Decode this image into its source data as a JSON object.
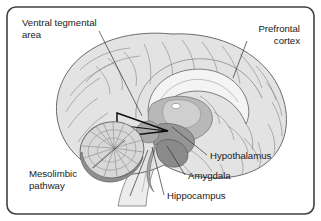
{
  "figure": {
    "type": "anatomical-diagram",
    "background_color": "#ffffff",
    "frame": {
      "shape": "rounded-rectangle",
      "stroke_color": "#404040",
      "corner_radius": 9
    },
    "palette": {
      "cortex_fill": "#e3e3e3",
      "cortex_stroke": "#6b6b6b",
      "gyri_line": "#808080",
      "cerebellum_fill": "#d8d8d8",
      "cerebellum_rim": "#8a8a8a",
      "limbic_mid_gray": "#b4b4b4",
      "limbic_dark_gray": "#8e8e8e",
      "vta_outline": "#101010",
      "white_matter": "#f2f2f2",
      "label_text": "#1a1a1a",
      "leader_line": "#303030"
    }
  },
  "labels": [
    {
      "id": "ventral-tegmental-area",
      "lines": [
        "Ventral tegmental",
        "area"
      ],
      "line1": "Ventral tegmental",
      "line2": "area",
      "x": 22,
      "y": 26,
      "align": "start"
    },
    {
      "id": "prefrontal-cortex",
      "lines": [
        "Prefrontal",
        "cortex"
      ],
      "line1": "Prefrontal",
      "line2": "cortex",
      "x": 300,
      "y": 32,
      "align": "end"
    },
    {
      "id": "mesolimbic-pathway",
      "lines": [
        "Mesolimbic",
        "pathway"
      ],
      "line1": "Mesolimbic",
      "line2": "pathway",
      "x": 29,
      "y": 177,
      "align": "start"
    },
    {
      "id": "hypothalamus",
      "lines": [
        "Hypothalamus"
      ],
      "line1": "Hypothalamus",
      "x": 210,
      "y": 159,
      "align": "start"
    },
    {
      "id": "amygdala",
      "lines": [
        "Amygdala"
      ],
      "line1": "Amygdala",
      "x": 188,
      "y": 179,
      "align": "start"
    },
    {
      "id": "hippocampus",
      "lines": [
        "Hippocampus"
      ],
      "line1": "Hippocampus",
      "x": 167,
      "y": 199,
      "align": "start"
    }
  ],
  "structures": [
    {
      "id": "cerebral-cortex",
      "name": "Cerebral cortex"
    },
    {
      "id": "corpus-callosum",
      "name": "Corpus callosum"
    },
    {
      "id": "thalamus",
      "name": "Thalamus"
    },
    {
      "id": "cerebellum",
      "name": "Cerebellum"
    },
    {
      "id": "brainstem",
      "name": "Brainstem"
    },
    {
      "id": "vta-region",
      "name": "Ventral tegmental area region"
    },
    {
      "id": "amygdala-body",
      "name": "Amygdala"
    },
    {
      "id": "hippocampus-body",
      "name": "Hippocampus"
    }
  ]
}
